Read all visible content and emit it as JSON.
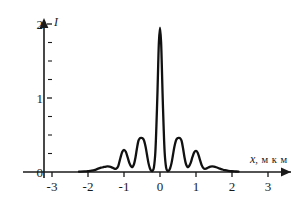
{
  "chart_data": {
    "type": "line",
    "title": "",
    "subtitle": "",
    "xlabel": "x, мкм",
    "xlabel_variable": "x",
    "xlabel_units": ", м к м",
    "ylabel": "I",
    "xlim": [
      -3,
      3
    ],
    "ylim": [
      0,
      2
    ],
    "grid": false,
    "legend": null,
    "xticks": [
      -3,
      -2,
      -1,
      0,
      1,
      2,
      3
    ],
    "xticklabels": [
      "-3",
      "-2",
      "-1",
      "0",
      "1",
      "2",
      "3"
    ],
    "yticks": [
      0,
      1,
      2
    ],
    "yticklabels": [
      "0",
      "1",
      "2"
    ],
    "y_minor_tick_step": 0.25,
    "y_axis_position_x": -3,
    "series": [
      {
        "name": "intensity",
        "color": "#111111",
        "peaks": [
          {
            "x": 0.0,
            "y": 1.95
          },
          {
            "x": -0.5,
            "y": 0.46
          },
          {
            "x": 0.5,
            "y": 0.46
          },
          {
            "x": -1.0,
            "y": 0.3
          },
          {
            "x": 1.0,
            "y": 0.285
          },
          {
            "x": -1.45,
            "y": 0.075
          },
          {
            "x": 1.45,
            "y": 0.075
          }
        ],
        "x": [
          -2.25,
          -2.1,
          -2.0,
          -1.9,
          -1.8,
          -1.72,
          -1.64,
          -1.56,
          -1.5,
          -1.45,
          -1.4,
          -1.34,
          -1.28,
          -1.22,
          -1.16,
          -1.1,
          -1.05,
          -1.0,
          -0.95,
          -0.9,
          -0.85,
          -0.8,
          -0.76,
          -0.72,
          -0.68,
          -0.64,
          -0.6,
          -0.56,
          -0.52,
          -0.5,
          -0.47,
          -0.44,
          -0.4,
          -0.36,
          -0.32,
          -0.28,
          -0.25,
          -0.21,
          -0.17,
          -0.13,
          -0.1,
          -0.07,
          -0.05,
          -0.03,
          0.0,
          0.03,
          0.05,
          0.07,
          0.1,
          0.13,
          0.17,
          0.21,
          0.25,
          0.28,
          0.32,
          0.36,
          0.4,
          0.44,
          0.47,
          0.5,
          0.52,
          0.56,
          0.6,
          0.64,
          0.68,
          0.72,
          0.76,
          0.8,
          0.85,
          0.9,
          0.95,
          1.0,
          1.05,
          1.1,
          1.16,
          1.22,
          1.28,
          1.34,
          1.4,
          1.45,
          1.5,
          1.56,
          1.64,
          1.72,
          1.8,
          1.9,
          2.0,
          2.1,
          2.18
        ],
        "y": [
          0.005,
          0.008,
          0.012,
          0.018,
          0.03,
          0.045,
          0.058,
          0.068,
          0.074,
          0.075,
          0.072,
          0.062,
          0.048,
          0.045,
          0.08,
          0.19,
          0.27,
          0.3,
          0.272,
          0.2,
          0.12,
          0.075,
          0.07,
          0.11,
          0.2,
          0.32,
          0.42,
          0.455,
          0.462,
          0.46,
          0.45,
          0.42,
          0.34,
          0.23,
          0.12,
          0.048,
          0.02,
          0.015,
          0.06,
          0.26,
          0.62,
          1.08,
          1.45,
          1.76,
          1.95,
          1.76,
          1.45,
          1.08,
          0.62,
          0.26,
          0.06,
          0.015,
          0.02,
          0.048,
          0.12,
          0.23,
          0.34,
          0.42,
          0.45,
          0.46,
          0.462,
          0.455,
          0.42,
          0.32,
          0.2,
          0.11,
          0.07,
          0.075,
          0.12,
          0.2,
          0.265,
          0.285,
          0.258,
          0.182,
          0.09,
          0.045,
          0.046,
          0.06,
          0.072,
          0.075,
          0.072,
          0.064,
          0.05,
          0.036,
          0.024,
          0.015,
          0.01,
          0.007,
          0.005
        ]
      }
    ]
  },
  "axes": {
    "x_axis_name": "x-axis",
    "y_axis_name": "y-axis",
    "arrow_x": "right",
    "arrow_y": "up"
  }
}
